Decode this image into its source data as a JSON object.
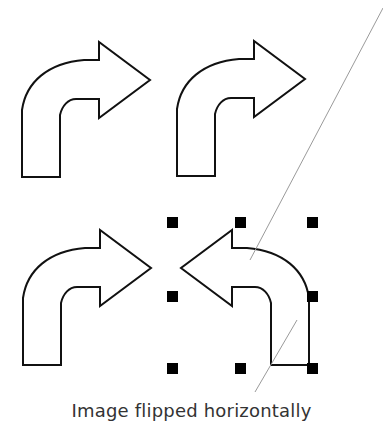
{
  "figure": {
    "caption": "Image flipped horizontally",
    "colors": {
      "background": "#ffffff",
      "outline": "#111111",
      "handle": "#000000",
      "guide_line": "#9a9a9a",
      "caption_text": "#333333"
    },
    "shapes": [
      {
        "name": "bent-arrow-original-top-left",
        "direction": "right"
      },
      {
        "name": "bent-arrow-original-top-right",
        "direction": "right"
      },
      {
        "name": "bent-arrow-original-bottom-left",
        "direction": "right"
      },
      {
        "name": "bent-arrow-flipped-bottom-right",
        "direction": "left",
        "selected": true
      }
    ]
  }
}
